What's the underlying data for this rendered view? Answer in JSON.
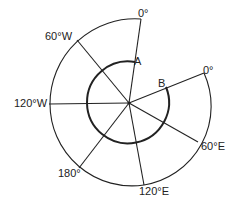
{
  "diagram": {
    "labels": {
      "top_zero": "0°",
      "right_zero": "0°",
      "w60": "60°W",
      "w120": "120°W",
      "d180": "180°",
      "e120": "120°E",
      "e60": "60°E",
      "point_a": "A",
      "point_b": "B"
    },
    "colors": {
      "stroke": "#222222",
      "background": "#ffffff"
    }
  }
}
